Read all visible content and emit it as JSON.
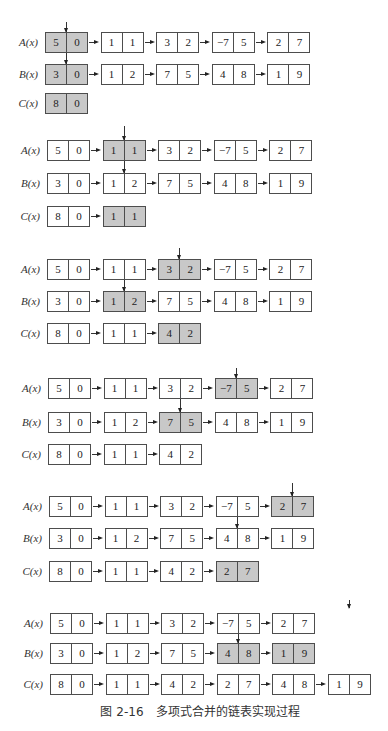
{
  "figure": {
    "caption_number": "图 2-16",
    "caption_title": "多项式合并的链表实现过程"
  },
  "colors": {
    "highlight": "#c8c8c8",
    "border": "#4d4d4d",
    "text": "#222222"
  },
  "stages": [
    {
      "step": 1,
      "pointer_a_index": 0,
      "pointer_b_index": 0,
      "rows": [
        {
          "label": "A(x)",
          "nodes": [
            {
              "coef": "5",
              "exp": "0",
              "highlighted": true
            },
            {
              "coef": "1",
              "exp": "1",
              "highlighted": false
            },
            {
              "coef": "3",
              "exp": "2",
              "highlighted": false
            },
            {
              "coef": "−7",
              "exp": "5",
              "highlighted": false
            },
            {
              "coef": "2",
              "exp": "7",
              "highlighted": false
            }
          ]
        },
        {
          "label": "B(x)",
          "nodes": [
            {
              "coef": "3",
              "exp": "0",
              "highlighted": true
            },
            {
              "coef": "1",
              "exp": "2",
              "highlighted": false
            },
            {
              "coef": "7",
              "exp": "5",
              "highlighted": false
            },
            {
              "coef": "4",
              "exp": "8",
              "highlighted": false
            },
            {
              "coef": "1",
              "exp": "9",
              "highlighted": false
            }
          ]
        },
        {
          "label": "C(x)",
          "nodes": [
            {
              "coef": "8",
              "exp": "0",
              "highlighted": true
            }
          ]
        }
      ]
    },
    {
      "step": 2,
      "pointer_a_index": 1,
      "pointer_b_index": 1,
      "rows": [
        {
          "label": "A(x)",
          "nodes": [
            {
              "coef": "5",
              "exp": "0",
              "highlighted": false
            },
            {
              "coef": "1",
              "exp": "1",
              "highlighted": true
            },
            {
              "coef": "3",
              "exp": "2",
              "highlighted": false
            },
            {
              "coef": "−7",
              "exp": "5",
              "highlighted": false
            },
            {
              "coef": "2",
              "exp": "7",
              "highlighted": false
            }
          ]
        },
        {
          "label": "B(x)",
          "nodes": [
            {
              "coef": "3",
              "exp": "0",
              "highlighted": false
            },
            {
              "coef": "1",
              "exp": "2",
              "highlighted": false
            },
            {
              "coef": "7",
              "exp": "5",
              "highlighted": false
            },
            {
              "coef": "4",
              "exp": "8",
              "highlighted": false
            },
            {
              "coef": "1",
              "exp": "9",
              "highlighted": false
            }
          ]
        },
        {
          "label": "C(x)",
          "nodes": [
            {
              "coef": "8",
              "exp": "0",
              "highlighted": false
            },
            {
              "coef": "1",
              "exp": "1",
              "highlighted": true
            }
          ]
        }
      ]
    },
    {
      "step": 3,
      "pointer_a_index": 2,
      "pointer_b_index": 1,
      "rows": [
        {
          "label": "A(x)",
          "nodes": [
            {
              "coef": "5",
              "exp": "0",
              "highlighted": false
            },
            {
              "coef": "1",
              "exp": "1",
              "highlighted": false
            },
            {
              "coef": "3",
              "exp": "2",
              "highlighted": true
            },
            {
              "coef": "−7",
              "exp": "5",
              "highlighted": false
            },
            {
              "coef": "2",
              "exp": "7",
              "highlighted": false
            }
          ]
        },
        {
          "label": "B(x)",
          "nodes": [
            {
              "coef": "3",
              "exp": "0",
              "highlighted": false
            },
            {
              "coef": "1",
              "exp": "2",
              "highlighted": true
            },
            {
              "coef": "7",
              "exp": "5",
              "highlighted": false
            },
            {
              "coef": "4",
              "exp": "8",
              "highlighted": false
            },
            {
              "coef": "1",
              "exp": "9",
              "highlighted": false
            }
          ]
        },
        {
          "label": "C(x)",
          "nodes": [
            {
              "coef": "8",
              "exp": "0",
              "highlighted": false
            },
            {
              "coef": "1",
              "exp": "1",
              "highlighted": false
            },
            {
              "coef": "4",
              "exp": "2",
              "highlighted": true
            }
          ]
        }
      ]
    },
    {
      "step": 4,
      "pointer_a_index": 3,
      "pointer_b_index": 2,
      "rows": [
        {
          "label": "A(x)",
          "nodes": [
            {
              "coef": "5",
              "exp": "0",
              "highlighted": false
            },
            {
              "coef": "1",
              "exp": "1",
              "highlighted": false
            },
            {
              "coef": "3",
              "exp": "2",
              "highlighted": false
            },
            {
              "coef": "−7",
              "exp": "5",
              "highlighted": true
            },
            {
              "coef": "2",
              "exp": "7",
              "highlighted": false
            }
          ]
        },
        {
          "label": "B(x)",
          "nodes": [
            {
              "coef": "3",
              "exp": "0",
              "highlighted": false
            },
            {
              "coef": "1",
              "exp": "2",
              "highlighted": false
            },
            {
              "coef": "7",
              "exp": "5",
              "highlighted": true
            },
            {
              "coef": "4",
              "exp": "8",
              "highlighted": false
            },
            {
              "coef": "1",
              "exp": "9",
              "highlighted": false
            }
          ]
        },
        {
          "label": "C(x)",
          "nodes": [
            {
              "coef": "8",
              "exp": "0",
              "highlighted": false
            },
            {
              "coef": "1",
              "exp": "1",
              "highlighted": false
            },
            {
              "coef": "4",
              "exp": "2",
              "highlighted": false
            }
          ]
        }
      ]
    },
    {
      "step": 5,
      "pointer_a_index": 4,
      "pointer_b_index": 3,
      "rows": [
        {
          "label": "A(x)",
          "nodes": [
            {
              "coef": "5",
              "exp": "0",
              "highlighted": false
            },
            {
              "coef": "1",
              "exp": "1",
              "highlighted": false
            },
            {
              "coef": "3",
              "exp": "2",
              "highlighted": false
            },
            {
              "coef": "−7",
              "exp": "5",
              "highlighted": false
            },
            {
              "coef": "2",
              "exp": "7",
              "highlighted": true
            }
          ]
        },
        {
          "label": "B(x)",
          "nodes": [
            {
              "coef": "3",
              "exp": "0",
              "highlighted": false
            },
            {
              "coef": "1",
              "exp": "2",
              "highlighted": false
            },
            {
              "coef": "7",
              "exp": "5",
              "highlighted": false
            },
            {
              "coef": "4",
              "exp": "8",
              "highlighted": false
            },
            {
              "coef": "1",
              "exp": "9",
              "highlighted": false
            }
          ]
        },
        {
          "label": "C(x)",
          "nodes": [
            {
              "coef": "8",
              "exp": "0",
              "highlighted": false
            },
            {
              "coef": "1",
              "exp": "1",
              "highlighted": false
            },
            {
              "coef": "4",
              "exp": "2",
              "highlighted": false
            },
            {
              "coef": "2",
              "exp": "7",
              "highlighted": true
            }
          ]
        }
      ]
    },
    {
      "step": 6,
      "pointer_a_index": 5,
      "pointer_b_index": 3,
      "rows": [
        {
          "label": "A(x)",
          "nodes": [
            {
              "coef": "5",
              "exp": "0",
              "highlighted": false
            },
            {
              "coef": "1",
              "exp": "1",
              "highlighted": false
            },
            {
              "coef": "3",
              "exp": "2",
              "highlighted": false
            },
            {
              "coef": "−7",
              "exp": "5",
              "highlighted": false
            },
            {
              "coef": "2",
              "exp": "7",
              "highlighted": false
            }
          ]
        },
        {
          "label": "B(x)",
          "nodes": [
            {
              "coef": "3",
              "exp": "0",
              "highlighted": false
            },
            {
              "coef": "1",
              "exp": "2",
              "highlighted": false
            },
            {
              "coef": "7",
              "exp": "5",
              "highlighted": false
            },
            {
              "coef": "4",
              "exp": "8",
              "highlighted": true
            },
            {
              "coef": "1",
              "exp": "9",
              "highlighted": true
            }
          ]
        },
        {
          "label": "C(x)",
          "nodes": [
            {
              "coef": "8",
              "exp": "0",
              "highlighted": false
            },
            {
              "coef": "1",
              "exp": "1",
              "highlighted": false
            },
            {
              "coef": "4",
              "exp": "2",
              "highlighted": false
            },
            {
              "coef": "2",
              "exp": "7",
              "highlighted": false
            },
            {
              "coef": "4",
              "exp": "8",
              "highlighted": false
            },
            {
              "coef": "1",
              "exp": "9",
              "highlighted": false
            }
          ]
        }
      ]
    }
  ]
}
